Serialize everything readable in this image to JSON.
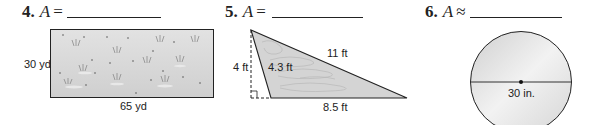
{
  "problems": [
    {
      "number": "4.",
      "variable": "A",
      "relation": "=",
      "shape": "rectangle",
      "dimensions": {
        "height_label": "30 yd",
        "width_label": "65 yd"
      }
    },
    {
      "number": "5.",
      "variable": "A",
      "relation": "=",
      "shape": "triangle",
      "dimensions": {
        "height_label": "4 ft",
        "left_side_label": "4.3 ft",
        "hypotenuse_label": "11 ft",
        "base_label": "8.5 ft"
      }
    },
    {
      "number": "6.",
      "variable": "A",
      "relation": "≈",
      "shape": "circle",
      "dimensions": {
        "diameter_label": "30 in."
      }
    }
  ],
  "colors": {
    "figure_fill": "#d4d4d4",
    "stroke": "#222222",
    "rect_fill": "#dcdcdc"
  }
}
